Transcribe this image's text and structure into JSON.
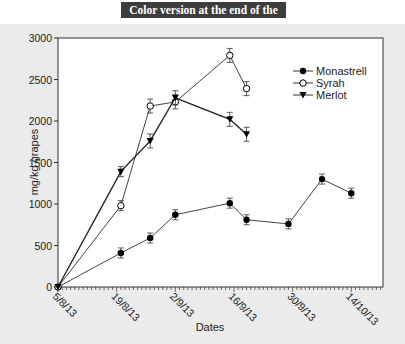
{
  "banner": {
    "text": "Color version at the end of the book"
  },
  "chart_data": {
    "type": "line",
    "title": "",
    "xlabel": "Dates",
    "ylabel": "mg/kg grapes",
    "ylim": [
      0,
      3000
    ],
    "yticks": [
      0,
      500,
      1000,
      1500,
      2000,
      2500,
      3000
    ],
    "xtick_labels": [
      "5/8/13",
      "19/8/13",
      "2/9/13",
      "16/9/13",
      "30/9/13",
      "14/10/13"
    ],
    "grid": false,
    "legend_position": "upper right",
    "series": [
      {
        "name": "Monastrell",
        "marker": "filled-circle",
        "x": [
          "5/8/13",
          "20/8/13",
          "27/8/13",
          "2/9/13",
          "15/9/13",
          "19/9/13",
          "29/9/13",
          "7/10/13",
          "14/10/13"
        ],
        "values": [
          0,
          410,
          590,
          870,
          1010,
          810,
          760,
          1300,
          1130
        ]
      },
      {
        "name": "Syrah",
        "marker": "open-circle",
        "x": [
          "5/8/13",
          "20/8/13",
          "27/8/13",
          "2/9/13",
          "15/9/13",
          "19/9/13"
        ],
        "values": [
          0,
          980,
          2180,
          2230,
          2790,
          2390
        ]
      },
      {
        "name": "Merlot",
        "marker": "filled-triangle-down",
        "x": [
          "5/8/13",
          "20/8/13",
          "27/8/13",
          "2/9/13",
          "15/9/13",
          "19/9/13"
        ],
        "values": [
          0,
          1390,
          1760,
          2280,
          2020,
          1840
        ]
      }
    ]
  }
}
